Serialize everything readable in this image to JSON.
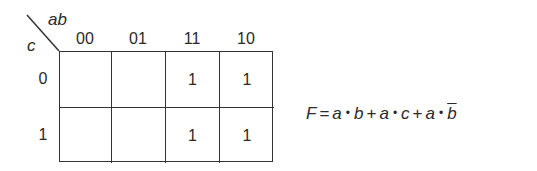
{
  "kmap": {
    "col_variable": "ab",
    "row_variable": "c",
    "col_headers": [
      "00",
      "01",
      "11",
      "10"
    ],
    "row_headers": [
      "0",
      "1"
    ],
    "cells": [
      [
        "",
        "",
        "1",
        "1"
      ],
      [
        "",
        "",
        "1",
        "1"
      ]
    ]
  },
  "formula": {
    "lhs": "F",
    "eq": "=",
    "terms": [
      {
        "v1": "a",
        "v2": "b",
        "v2_bar": false
      },
      {
        "v1": "a",
        "v2": "c",
        "v2_bar": false
      },
      {
        "v1": "a",
        "v2": "b",
        "v2_bar": true
      }
    ],
    "dot": "•",
    "plus": "+"
  },
  "colors": {
    "ink": "#2a2a2a",
    "background": "#ffffff"
  }
}
